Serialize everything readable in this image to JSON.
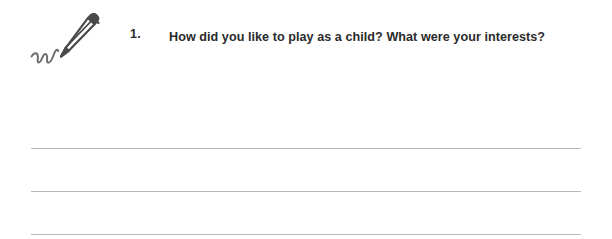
{
  "document": {
    "question_number": "1.",
    "question_text": "How did you like to play as a child? What were your interests?",
    "icon_name": "fountain-pen-writing-icon",
    "answer_lines": [
      {
        "id": "answer-line-1"
      },
      {
        "id": "answer-line-2"
      },
      {
        "id": "answer-line-3"
      }
    ],
    "colors": {
      "text": "#2b2b2b",
      "rule": "#b9b9b9",
      "pen_stroke": "#4a4a4a",
      "background": "#ffffff"
    }
  }
}
